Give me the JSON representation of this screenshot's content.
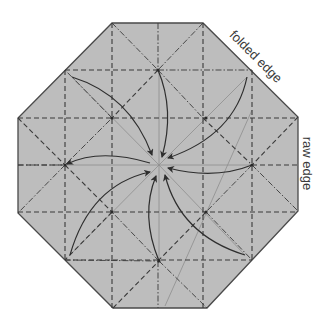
{
  "diagram": {
    "colors": {
      "paper": "#bdbdbd",
      "edge": "#4a4a4a",
      "crease": "#3a3a3a",
      "guide": "#8e8e8e",
      "arrow": "#2e2e2e",
      "dot": "#2a2a2a"
    },
    "octagon": [
      [
        112,
        23
      ],
      [
        203,
        23
      ],
      [
        298,
        117
      ],
      [
        298,
        211
      ],
      [
        207,
        308
      ],
      [
        113,
        308
      ],
      [
        18,
        213
      ],
      [
        18,
        118
      ]
    ],
    "center": [
      159,
      165
    ],
    "valley_lines": [
      [
        112,
        23,
        112,
        308
      ],
      [
        203,
        23,
        203,
        308
      ],
      [
        65,
        70,
        65,
        260
      ],
      [
        252,
        70,
        252,
        260
      ],
      [
        65,
        70,
        158,
        70
      ],
      [
        18,
        118,
        298,
        118
      ],
      [
        18,
        212,
        298,
        212
      ],
      [
        65,
        260,
        252,
        260
      ],
      [
        18,
        165,
        65,
        165
      ],
      [
        252,
        165,
        298,
        165
      ],
      [
        18,
        118,
        65,
        165
      ],
      [
        298,
        117,
        252,
        165
      ],
      [
        158,
        70,
        112,
        118
      ],
      [
        203,
        118,
        250,
        163
      ],
      [
        65,
        165,
        112,
        212
      ],
      [
        206,
        212,
        158,
        261
      ],
      [
        112,
        212,
        65,
        260
      ],
      [
        113,
        308,
        159,
        261
      ]
    ],
    "mountain_lines": [
      [
        158,
        23,
        158,
        70
      ],
      [
        158,
        261,
        158,
        308
      ],
      [
        158,
        70,
        252,
        70
      ],
      [
        112,
        23,
        158,
        70
      ],
      [
        203,
        23,
        158,
        70
      ],
      [
        158,
        70,
        203,
        118
      ],
      [
        65,
        165,
        112,
        118
      ],
      [
        65,
        165,
        18,
        213
      ],
      [
        252,
        165,
        298,
        211
      ],
      [
        252,
        165,
        206,
        212
      ],
      [
        159,
        261,
        207,
        308
      ],
      [
        159,
        261,
        112,
        212
      ],
      [
        112,
        118,
        65,
        70
      ],
      [
        65,
        260,
        159,
        261
      ],
      [
        206,
        212,
        252,
        260
      ],
      [
        18,
        165,
        65,
        165
      ]
    ],
    "guide_lines": [
      [
        72,
        77,
        159,
        165
      ],
      [
        247,
        77,
        159,
        165
      ],
      [
        70,
        255,
        159,
        165
      ],
      [
        245,
        255,
        159,
        165
      ],
      [
        65,
        165,
        159,
        165
      ],
      [
        252,
        165,
        159,
        165
      ],
      [
        159,
        70,
        159,
        165
      ],
      [
        159,
        261,
        159,
        165
      ],
      [
        252,
        110,
        165,
        306
      ]
    ],
    "dots": [
      [
        158,
        70
      ],
      [
        112,
        118
      ],
      [
        65,
        165
      ],
      [
        252,
        165
      ],
      [
        206,
        118
      ],
      [
        206,
        212
      ],
      [
        112,
        212
      ],
      [
        159,
        261
      ]
    ],
    "arrows": [
      {
        "id": "arrow-top-left-corner",
        "path": "M72,77 Q130,95 152,155"
      },
      {
        "id": "arrow-top-point",
        "path": "M158,70 Q175,110 162,157"
      },
      {
        "id": "arrow-top-right-corner",
        "path": "M247,77 Q235,135 168,158"
      },
      {
        "id": "arrow-right-point",
        "path": "M252,165 Q215,180 168,168"
      },
      {
        "id": "arrow-bottom-right-corner",
        "path": "M245,255 Q180,235 165,175"
      },
      {
        "id": "arrow-bottom-point",
        "path": "M159,261 Q140,215 156,176"
      },
      {
        "id": "arrow-bottom-left-corner",
        "path": "M70,255 Q90,185 150,172"
      },
      {
        "id": "arrow-left-point",
        "path": "M150,163 Q100,148 67,164"
      }
    ],
    "labels": {
      "folded_edge": "folded edge",
      "raw_edge": "raw edge"
    }
  }
}
